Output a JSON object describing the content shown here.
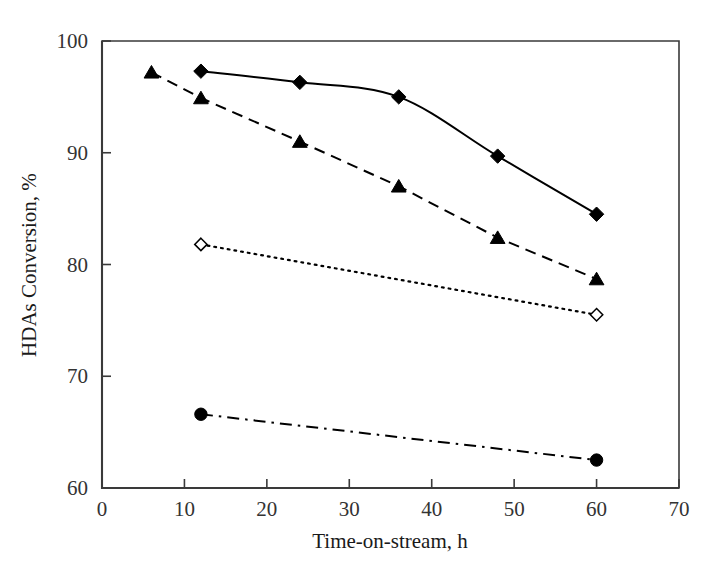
{
  "chart_data": {
    "type": "line",
    "title": "",
    "xlabel": "Time-on-stream, h",
    "ylabel": "HDAs Conversion, %",
    "xlim": [
      0,
      70
    ],
    "ylim": [
      60,
      100
    ],
    "xticks": [
      0,
      10,
      20,
      30,
      40,
      50,
      60,
      70
    ],
    "xtick_labels": [
      "0",
      "10",
      "20",
      "30",
      "40",
      "50",
      "60",
      "70"
    ],
    "yticks": [
      60,
      70,
      80,
      90,
      100
    ],
    "ytick_labels": [
      "60",
      "70",
      "80",
      "90",
      "100"
    ],
    "grid": false,
    "legend": "none",
    "series": [
      {
        "name": "solid-filled-diamond",
        "marker": "filled-diamond",
        "linestyle": "solid",
        "color": "#000000",
        "x": [
          12,
          24,
          36,
          48,
          60
        ],
        "y": [
          97.3,
          96.3,
          95.0,
          89.7,
          84.5
        ]
      },
      {
        "name": "dashed-filled-triangle",
        "marker": "filled-triangle",
        "linestyle": "dashed",
        "color": "#000000",
        "x": [
          6,
          12,
          24,
          36,
          48,
          60
        ],
        "y": [
          97.2,
          94.9,
          91.0,
          87.0,
          82.4,
          78.7
        ]
      },
      {
        "name": "dotted-open-diamond",
        "marker": "open-diamond",
        "linestyle": "dotted",
        "color": "#000000",
        "x": [
          12,
          60
        ],
        "y": [
          81.8,
          75.5
        ]
      },
      {
        "name": "dashdot-filled-circle",
        "marker": "filled-circle",
        "linestyle": "dashdot",
        "color": "#000000",
        "x": [
          12,
          60
        ],
        "y": [
          66.6,
          62.5
        ]
      }
    ]
  },
  "axes": {
    "x_title": "Time-on-stream, h",
    "y_title": "HDAs Conversion, %"
  }
}
